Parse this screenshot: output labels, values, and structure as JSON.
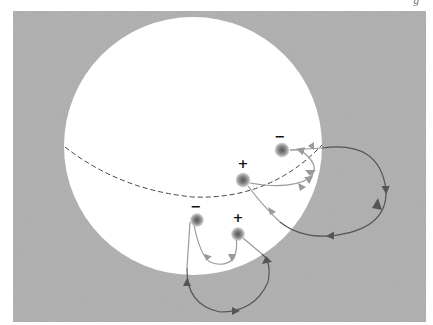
{
  "figure": {
    "caption_fragment": "g",
    "background_color": "#a9a9a9",
    "sphere_color": "#ffffff",
    "line_on_sphere_color": "#9a9a9a",
    "line_off_sphere_color": "#555555"
  },
  "sphere": {
    "cx": 193,
    "cy": 146,
    "r": 129
  },
  "equator": {
    "style": "dashed"
  },
  "spot_pairs": [
    {
      "name": "upper-pair",
      "spots": [
        {
          "polarity": "-",
          "label": "−",
          "x": 282,
          "y": 150
        },
        {
          "polarity": "+",
          "label": "+",
          "x": 243,
          "y": 180
        }
      ]
    },
    {
      "name": "lower-pair",
      "spots": [
        {
          "polarity": "-",
          "label": "−",
          "x": 197,
          "y": 220
        },
        {
          "polarity": "+",
          "label": "+",
          "x": 238,
          "y": 234
        }
      ]
    }
  ],
  "labels": {
    "upper_minus": "−",
    "upper_plus": "+",
    "lower_minus": "−",
    "lower_plus": "+"
  }
}
